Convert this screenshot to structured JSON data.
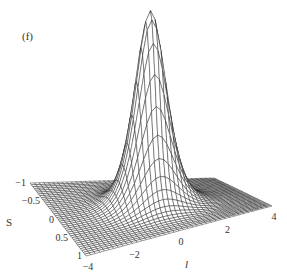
{
  "chart_data": {
    "type": "surface",
    "panel_label": "(f)",
    "title": "",
    "x_axis": {
      "label": "l",
      "range": [
        -4,
        4
      ],
      "ticks": [
        -4,
        -2,
        0,
        2,
        4
      ],
      "tick_labels": [
        "−4",
        "−2",
        "0",
        "2",
        "4"
      ]
    },
    "y_axis": {
      "label": "S",
      "range": [
        -1,
        1
      ],
      "ticks": [
        -1,
        -0.5,
        0,
        0.5,
        1
      ],
      "tick_labels": [
        "−1",
        "−0.5",
        "0",
        "0.5",
        "1"
      ]
    },
    "z_axis": {
      "label": "",
      "shown": false
    },
    "surface": {
      "description": "single localized peak centered at l=0, S=0 on a flat base",
      "peak_center": {
        "l": 0,
        "S": 0
      },
      "peak_height": 1.0,
      "base_level": 0.0,
      "width_l": 1.1,
      "width_S": 0.3,
      "grid_lines_l": 40,
      "grid_lines_S": 40,
      "style": "wireframe mesh, hidden-line removal"
    }
  }
}
